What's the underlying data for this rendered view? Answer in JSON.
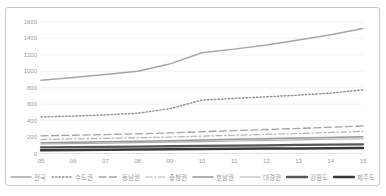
{
  "frame": {
    "background": "#ffffff",
    "border_color": "#c6c6c6"
  },
  "chart_data": {
    "type": "line",
    "title": "",
    "xlabel": "",
    "ylabel": "",
    "x": [
      "05",
      "06",
      "07",
      "08",
      "09",
      "10",
      "11",
      "12",
      "13",
      "14",
      "15"
    ],
    "ylim": [
      0,
      1600
    ],
    "ytick_step": 200,
    "yticks": [
      0,
      200,
      400,
      600,
      800,
      1000,
      1200,
      1400,
      1600
    ],
    "grid": true,
    "gridline_color": "#ececec",
    "axis_line_color": "#d6d6d6",
    "tick_label_color": "#9a9a9a",
    "legend_position": "bottom",
    "series": [
      {
        "name": "전국",
        "color": "#a6a6a6",
        "dash": "solid",
        "width": 1.5,
        "values": [
          890,
          925,
          960,
          1000,
          1090,
          1225,
          1270,
          1320,
          1380,
          1445,
          1520
        ]
      },
      {
        "name": "수도권",
        "color": "#8f8f8f",
        "dash": "dotted",
        "width": 1.4,
        "values": [
          445,
          455,
          470,
          490,
          545,
          650,
          670,
          690,
          710,
          735,
          775
        ]
      },
      {
        "name": "동남권",
        "color": "#a3a3a3",
        "dash": "dashed",
        "width": 1.3,
        "values": [
          215,
          222,
          230,
          240,
          250,
          265,
          278,
          292,
          305,
          320,
          335
        ]
      },
      {
        "name": "충청권",
        "color": "#b3b3b3",
        "dash": "dashdot",
        "width": 1.2,
        "values": [
          170,
          177,
          184,
          192,
          200,
          212,
          222,
          233,
          244,
          256,
          270
        ]
      },
      {
        "name": "호남권",
        "color": "#969696",
        "dash": "solid",
        "width": 1.5,
        "values": [
          130,
          136,
          142,
          149,
          156,
          164,
          172,
          180,
          188,
          196,
          205
        ]
      },
      {
        "name": "대경권",
        "color": "#ababab",
        "dash": "solid",
        "width": 1.1,
        "values": [
          115,
          120,
          126,
          132,
          138,
          145,
          152,
          159,
          166,
          173,
          180
        ]
      },
      {
        "name": "강원도",
        "color": "#565656",
        "dash": "solid",
        "width": 2.3,
        "values": [
          75,
          78,
          81,
          84,
          88,
          92,
          96,
          100,
          104,
          108,
          112
        ]
      },
      {
        "name": "제주도",
        "color": "#383838",
        "dash": "solid",
        "width": 2.5,
        "values": [
          40,
          42,
          45,
          48,
          51,
          54,
          57,
          60,
          62,
          64,
          66
        ]
      }
    ]
  }
}
